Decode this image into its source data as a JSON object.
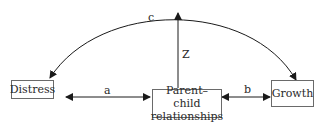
{
  "diagram": {
    "type": "path-model",
    "nodes": [
      {
        "id": "distress",
        "label": "Distress"
      },
      {
        "id": "parent_child",
        "label": "Parent–child relationships",
        "line1": "Parent–child",
        "line2": "relationships"
      },
      {
        "id": "growth",
        "label": "Growth"
      }
    ],
    "edges": [
      {
        "id": "a",
        "label": "a",
        "from": "distress",
        "to": "parent_child",
        "style": "bidirectional-straight"
      },
      {
        "id": "b",
        "label": "b",
        "from": "parent_child",
        "to": "growth",
        "style": "bidirectional-straight"
      },
      {
        "id": "c",
        "label": "c",
        "from": "distress",
        "to": "growth",
        "style": "bidirectional-curved"
      },
      {
        "id": "z",
        "label": "Z",
        "from": "parent_child",
        "to": "c",
        "style": "directed-straight"
      }
    ],
    "colors": {
      "line": "#1a1a1a",
      "box_border": "#6a6a6a",
      "text": "#2a2a2a",
      "background": "#ffffff"
    }
  }
}
